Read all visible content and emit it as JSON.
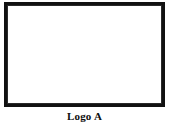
{
  "figure": {
    "caption": "Logo A",
    "background_color": "#ffffff",
    "frame_color": "#111111",
    "line_color": "#1a1a1a"
  },
  "chart_data": {
    "type": "line",
    "title": "Logo A",
    "subtitle": "",
    "xlabel": "",
    "ylabel": "",
    "xlim": [
      0,
      100
    ],
    "ylim": [
      0,
      100
    ],
    "grid": false,
    "legend": "none",
    "axis_ticks": {
      "x_tick_positions": [
        5,
        16,
        27,
        38,
        49,
        60,
        71,
        82,
        93
      ],
      "x_tick_labels": [
        "",
        "",
        "",
        "",
        "",
        "",
        "",
        "",
        ""
      ],
      "y_tick_positions": [
        12,
        30,
        48,
        66,
        84
      ],
      "y_tick_labels": [
        "",
        "",
        "",
        "",
        ""
      ],
      "tick_side_x": "bottom",
      "tick_side_y": "left"
    },
    "annotations": [
      "Star-polygon logo drawn as straight polyline segments between boundary vertices"
    ],
    "vertices": {
      "top_left": [
        5,
        95
      ],
      "top_apex": [
        50,
        95
      ],
      "top_right": [
        96,
        95
      ],
      "mid_left": [
        5,
        34
      ],
      "mid_right": [
        96,
        34
      ],
      "bottom_v": [
        51,
        3
      ]
    },
    "series": [
      {
        "name": "stroke-1",
        "x": [
          5,
          96
        ],
        "y": [
          95,
          34
        ]
      },
      {
        "name": "stroke-2",
        "x": [
          5,
          96
        ],
        "y": [
          95,
          34
        ]
      },
      {
        "name": "stroke-3",
        "x": [
          5,
          50,
          96
        ],
        "y": [
          34,
          95,
          34
        ]
      },
      {
        "name": "stroke-4",
        "x": [
          5,
          51,
          96
        ],
        "y": [
          34,
          3,
          95
        ]
      },
      {
        "name": "stroke-5",
        "x": [
          5,
          96
        ],
        "y": [
          34,
          34
        ]
      }
    ],
    "polyline_paths": [
      {
        "name": "path-a",
        "points": [
          [
            5,
            95
          ],
          [
            96,
            34
          ],
          [
            5,
            34
          ],
          [
            51,
            3
          ],
          [
            96,
            95
          ],
          [
            5,
            95
          ]
        ]
      },
      {
        "name": "path-b",
        "points": [
          [
            5,
            95
          ],
          [
            96,
            95
          ]
        ]
      },
      {
        "name": "path-c",
        "points": [
          [
            5,
            34
          ],
          [
            96,
            34
          ]
        ]
      },
      {
        "name": "path-d",
        "points": [
          [
            5,
            95
          ],
          [
            50,
            95
          ]
        ]
      }
    ]
  }
}
